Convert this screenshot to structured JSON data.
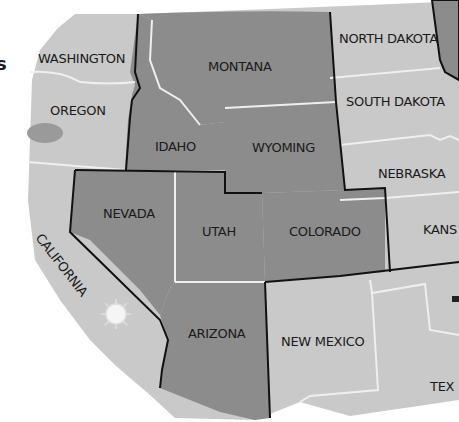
{
  "map": {
    "region": "Western United States",
    "colors": {
      "highlighted_state": "#8c8c8c",
      "other_state": "#c9c9c9",
      "background": "#ffffff",
      "highlight_border": "#111111",
      "state_divider": "#eeeeee",
      "lake": "#9a9a9a"
    },
    "edge_fragment": "s",
    "highlighted_states": [
      "MONTANA",
      "IDAHO",
      "WYOMING",
      "NEVADA",
      "UTAH",
      "COLORADO",
      "ARIZONA"
    ],
    "labels": {
      "washington": "WASHINGTON",
      "oregon": "OREGON",
      "california": "CALIFORNIA",
      "idaho": "IDAHO",
      "montana": "MONTANA",
      "wyoming": "WYOMING",
      "nevada": "NEVADA",
      "utah": "UTAH",
      "colorado": "COLORADO",
      "arizona": "ARIZONA",
      "new_mexico": "NEW MEXICO",
      "north_dakota": "NORTH DAKOTA",
      "south_dakota": "SOUTH DAKOTA",
      "nebraska": "NEBRASKA",
      "kansas": "KANS",
      "texas": "TEX"
    }
  }
}
